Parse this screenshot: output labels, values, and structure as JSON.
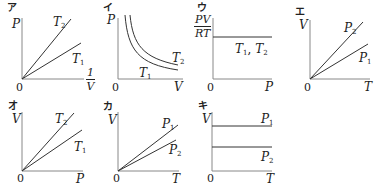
{
  "colors": {
    "line": "#333333",
    "axis": "#888888",
    "text": "#222222",
    "background": "#ffffff"
  },
  "panels": [
    {
      "tag": "ア",
      "xlabel": {
        "numerator": "1",
        "denominator": "V"
      },
      "ylabel": "P",
      "origin": "0",
      "curves": [
        {
          "label": "T",
          "sub": "2",
          "type": "line"
        },
        {
          "label": "T",
          "sub": "1",
          "type": "line"
        }
      ]
    },
    {
      "tag": "イ",
      "xlabel": "V",
      "ylabel": "P",
      "origin": "0",
      "curves": [
        {
          "label": "T",
          "sub": "2",
          "type": "hyperbola"
        },
        {
          "label": "T",
          "sub": "1",
          "type": "hyperbola"
        }
      ]
    },
    {
      "tag": "ウ",
      "xlabel": "P",
      "ylabel": {
        "numerator": "PV",
        "denominator": "RT"
      },
      "origin": "0",
      "curves": [
        {
          "label": "T₁, T₂",
          "l1": "T",
          "s1": "1",
          "sep": ", ",
          "l2": "T",
          "s2": "2",
          "type": "horizontal"
        }
      ]
    },
    {
      "tag": "エ",
      "xlabel": "T",
      "ylabel": "V",
      "origin": "0",
      "curves": [
        {
          "label": "P",
          "sub": "2",
          "type": "line"
        },
        {
          "label": "P",
          "sub": "1",
          "type": "line"
        }
      ]
    },
    {
      "tag": "オ",
      "xlabel": "P",
      "ylabel": "V",
      "origin": "0",
      "curves": [
        {
          "label": "T",
          "sub": "2",
          "type": "line"
        },
        {
          "label": "T",
          "sub": "1",
          "type": "line"
        }
      ]
    },
    {
      "tag": "カ",
      "xlabel": "T",
      "ylabel": "V",
      "origin": "0",
      "curves": [
        {
          "label": "P",
          "sub": "1",
          "type": "line"
        },
        {
          "label": "P",
          "sub": "2",
          "type": "line"
        }
      ]
    },
    {
      "tag": "キ",
      "xlabel": "T",
      "ylabel": "V",
      "origin": "0",
      "curves": [
        {
          "label": "P",
          "sub": "1",
          "type": "horizontal"
        },
        {
          "label": "P",
          "sub": "2",
          "type": "horizontal"
        }
      ]
    }
  ]
}
